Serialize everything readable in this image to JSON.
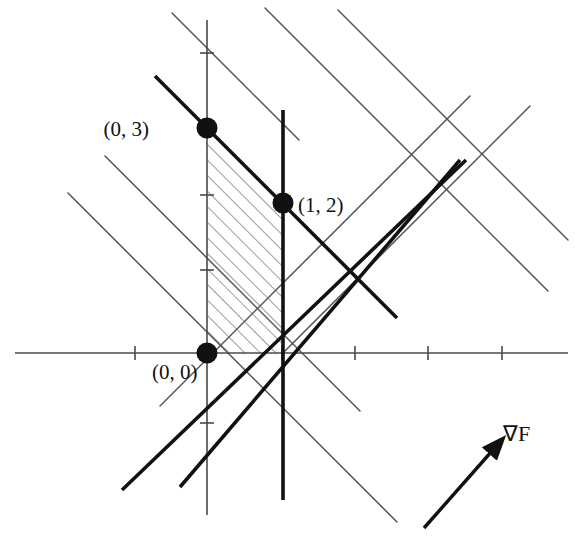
{
  "figure": {
    "name": "linear-programming-feasible-region",
    "width": 579,
    "height": 551,
    "background": "#ffffff",
    "ink": "#1a1a1a",
    "thin_line_color": "#555555",
    "hatch_color": "#666666"
  },
  "axes": {
    "origin_px": [
      207,
      353
    ],
    "unit_px": 75,
    "x_axis": {
      "name": "x-axis",
      "x_start_px": 15,
      "x_end_px": 568,
      "y_px": 353,
      "ticks_px": [
        135,
        282,
        355,
        428,
        502
      ]
    },
    "y_axis": {
      "name": "y-axis",
      "x_px": 207,
      "y_start_px": 20,
      "y_end_px": 515,
      "ticks_px": [
        53,
        195,
        270,
        423
      ]
    }
  },
  "points": [
    {
      "name": "vertex-0-3",
      "label": "(0, 3)",
      "px": [
        207,
        128
      ],
      "label_px": [
        149,
        136
      ],
      "anchor": "end"
    },
    {
      "name": "vertex-1-2",
      "label": "(1, 2)",
      "px": [
        283,
        203
      ],
      "label_px": [
        298,
        212
      ],
      "anchor": "start"
    },
    {
      "name": "vertex-0-0",
      "label": "(0, 0)",
      "px": [
        207,
        353
      ],
      "label_px": [
        152,
        379
      ],
      "anchor": "start"
    }
  ],
  "thick_lines": [
    {
      "name": "constraint-line-1",
      "x1": 155,
      "y1": 76,
      "x2": 397,
      "y2": 318
    },
    {
      "name": "constraint-line-2",
      "x1": 460,
      "y1": 160,
      "x2": 180,
      "y2": 487
    },
    {
      "name": "constraint-line-vertical",
      "x1": 283,
      "y1": 110,
      "x2": 283,
      "y2": 500
    },
    {
      "name": "constraint-line-3",
      "x1": 122,
      "y1": 490,
      "x2": 466,
      "y2": 160
    }
  ],
  "thin_level_lines": [
    {
      "name": "level-line-1",
      "x1": 172,
      "y1": 13,
      "x2": 299,
      "y2": 140
    },
    {
      "name": "level-line-2",
      "x1": 105,
      "y1": 156,
      "x2": 360,
      "y2": 411
    },
    {
      "name": "level-line-3",
      "x1": 68,
      "y1": 193,
      "x2": 397,
      "y2": 522
    },
    {
      "name": "level-line-4",
      "x1": 265,
      "y1": 8,
      "x2": 548,
      "y2": 291
    },
    {
      "name": "level-line-5",
      "x1": 338,
      "y1": 10,
      "x2": 568,
      "y2": 240
    }
  ],
  "thin_rising_lines": [
    {
      "name": "rising-line-1",
      "x1": 160,
      "y1": 406,
      "x2": 470,
      "y2": 96
    },
    {
      "name": "rising-line-2",
      "x1": 283,
      "y1": 353,
      "x2": 530,
      "y2": 106
    }
  ],
  "shaded_region": {
    "name": "feasible-region",
    "vertices_px": [
      [
        207,
        128
      ],
      [
        283,
        203
      ],
      [
        283,
        353
      ],
      [
        207,
        353
      ]
    ],
    "hatch_angle_deg": -45,
    "hatch_spacing_px": 11
  },
  "gradient_arrow": {
    "name": "gradient-arrow",
    "from_px": [
      424,
      528
    ],
    "to_px": [
      492,
      451
    ],
    "label": "∇F",
    "label_px": [
      503,
      441
    ]
  }
}
